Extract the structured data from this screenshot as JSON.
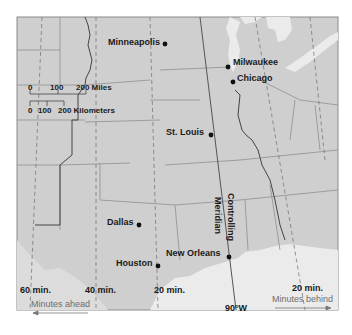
{
  "map": {
    "title": "",
    "colors": {
      "land": "#cfcfcf",
      "water": "#ebebeb",
      "background": "#ffffff",
      "borders": "#8a8a8a",
      "meridian": "#555555",
      "dashed": "#7a7a7a",
      "text": "#1a1a1a",
      "grey_text": "#6e6e6e"
    },
    "cities": [
      {
        "name": "Minneapolis",
        "x": 164,
        "y": 44
      },
      {
        "name": "Milwaukee",
        "x": 228,
        "y": 67
      },
      {
        "name": "Chicago",
        "x": 232,
        "y": 82
      },
      {
        "name": "St. Louis",
        "x": 211,
        "y": 135
      },
      {
        "name": "Dallas",
        "x": 139,
        "y": 225
      },
      {
        "name": "Houston",
        "x": 158,
        "y": 266
      },
      {
        "name": "New Orleans",
        "x": 229,
        "y": 257
      }
    ],
    "scale": {
      "miles_ticks": [
        "0",
        "100",
        "200 Miles"
      ],
      "km_ticks": [
        "0",
        "100",
        "200 Kilometers"
      ]
    },
    "meridian": {
      "label_line1": "Controlling",
      "label_line2": "Meridian",
      "longitude_label": "90°W"
    },
    "time_labels": {
      "sixty": "60 min.",
      "forty": "40 min.",
      "twenty_west": "20 min.",
      "twenty_east": "20 min.",
      "minutes_ahead": "Minutes ahead",
      "minutes_behind": "Minutes behind"
    }
  }
}
